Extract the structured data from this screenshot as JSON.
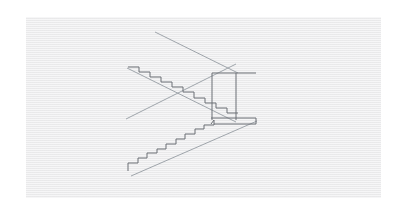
{
  "canvas": {
    "width": 407,
    "height": 215,
    "background_color": "#ffffff"
  },
  "panel": {
    "label": "drawing-panel",
    "x": 26,
    "y": 17,
    "width": 355,
    "height": 181,
    "fill_color": "#ececed",
    "texture": "horizontal-scanlines"
  },
  "drawing": {
    "title": "Perspective line drawing of a double-flight staircase with landing",
    "stroke_color": "#6b6f74",
    "stroke_color_light": "#9aa0a6",
    "stroke_width": 1,
    "stroke_width_thin": 0.9
  },
  "chart_data": {
    "type": "line-drawing",
    "stroke_color": "#6b6f74",
    "vanishing_construction_lines": [
      {
        "name": "top-construction-diagonal",
        "points": [
          [
            155,
            32
          ],
          [
            238,
            73
          ]
        ],
        "weight": "thin"
      },
      {
        "name": "upper-outer-stringer",
        "points": [
          [
            127,
            68
          ],
          [
            236,
            122
          ]
        ],
        "weight": "thin"
      },
      {
        "name": "crossing-diagonal-descending",
        "points": [
          [
            126,
            119
          ],
          [
            236,
            64
          ]
        ],
        "weight": "thin"
      },
      {
        "name": "lower-outer-stringer",
        "points": [
          [
            131,
            176
          ],
          [
            257,
            121
          ]
        ],
        "weight": "thin"
      }
    ],
    "upper_flight": {
      "name": "upper-stair-flight",
      "direction": "descending-left-to-right",
      "step_count": 9,
      "start": [
        139,
        72
      ],
      "end": [
        236,
        118
      ],
      "tread_run": 11,
      "riser_rise": 5.1,
      "top_landing_edge": [
        [
          128,
          68
        ],
        [
          139,
          72
        ]
      ]
    },
    "lower_flight": {
      "name": "lower-stair-flight",
      "direction": "ascending-left-to-right",
      "step_count": 9,
      "start": [
        128,
        163
      ],
      "end": [
        213,
        120
      ],
      "tread_run": 9.5,
      "riser_rise": 4.8,
      "bottom_edge": [
        [
          128,
          163
        ],
        [
          128,
          171
        ]
      ]
    },
    "landing": {
      "name": "landing-box",
      "left_vertical": [
        [
          212,
          73
        ],
        [
          212,
          120
        ]
      ],
      "right_vertical": [
        [
          236,
          73
        ],
        [
          236,
          120
        ]
      ],
      "top_horizontal": [
        [
          212,
          73
        ],
        [
          256,
          73
        ]
      ],
      "slab_top": [
        [
          211,
          118
        ],
        [
          256,
          118
        ]
      ],
      "slab_bottom": [
        [
          214,
          124
        ],
        [
          256,
          124
        ]
      ],
      "slab_right_edge": [
        [
          256,
          118
        ],
        [
          256,
          124
        ]
      ]
    },
    "xlim": [
      26,
      381
    ],
    "ylim": [
      17,
      198
    ],
    "grid": false,
    "legend": null
  }
}
